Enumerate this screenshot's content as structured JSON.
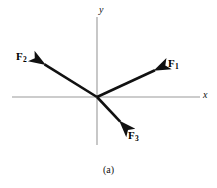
{
  "figure": {
    "caption": "(a)",
    "background_color": "#ffffff",
    "axis_color": "#9a9a9a",
    "vector_color": "#111111"
  },
  "axes": {
    "origin": {
      "x": 97,
      "y": 97
    },
    "x_axis": {
      "label": "x",
      "from_x": 12,
      "to_x": 200,
      "y": 97,
      "label_x": 203,
      "label_y": 91
    },
    "y_axis": {
      "label": "y",
      "x": 97,
      "from_y": 17,
      "to_y": 145,
      "label_x": 99,
      "label_y": 6
    }
  },
  "vectors": [
    {
      "name": "F1",
      "label": "F",
      "subscript": "1",
      "tail_x": 97,
      "tail_y": 97,
      "tip_x": 164,
      "tip_y": 66,
      "label_x": 168,
      "label_y": 59,
      "angle_deg": 25,
      "description": "force vector pointing up and to the right into the first quadrant"
    },
    {
      "name": "F2",
      "label": "F",
      "subscript": "2",
      "tail_x": 97,
      "tail_y": 97,
      "tip_x": 36,
      "tip_y": 59,
      "label_x": 16,
      "label_y": 52,
      "angle_deg": 148,
      "description": "force vector pointing up and to the left into the second quadrant"
    },
    {
      "name": "F3",
      "label": "F",
      "subscript": "3",
      "tail_x": 97,
      "tail_y": 97,
      "tip_x": 127,
      "tip_y": 129,
      "label_x": 128,
      "label_y": 131,
      "angle_deg": -47,
      "description": "force vector pointing down and to the right into the fourth quadrant"
    }
  ]
}
